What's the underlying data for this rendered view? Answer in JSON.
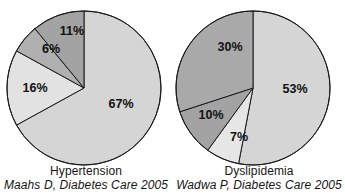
{
  "header": {
    "clipped_text_fragment": ""
  },
  "figure": {
    "background_color": "#ffffff",
    "outline_color": "#1a1a1a"
  },
  "panels": [
    {
      "id": "hypertension",
      "caption_title": "Hypertension",
      "caption_source": "Maahs D, Diabetes Care 2005"
    },
    {
      "id": "dyslipidemia",
      "caption_title": "Dyslipidemia",
      "caption_source": "Wadwa P, Diabetes Care 2005"
    }
  ],
  "chart_data": [
    {
      "type": "pie",
      "title": "Hypertension",
      "subtitle": "Maahs D, Diabetes Care 2005",
      "start_angle_deg": 0,
      "direction": "clockwise",
      "center": [
        84,
        88
      ],
      "radius": 77,
      "labels": [
        "67%",
        "16%",
        "6%",
        "11%"
      ],
      "values": [
        67,
        16,
        6,
        11
      ],
      "value_labels": [
        "67%",
        "16%",
        "6%",
        "11%"
      ],
      "colors": [
        "#d5d5d5",
        "#e2e2e2",
        "#b0b0b0",
        "#a3a3a3"
      ],
      "label_positions": [
        [
          121,
          105
        ],
        [
          35,
          89
        ],
        [
          51,
          50
        ],
        [
          72,
          32
        ]
      ],
      "legend": "none",
      "grid": false
    },
    {
      "type": "pie",
      "title": "Dyslipidemia",
      "subtitle": "Wadwa P, Diabetes Care 2005",
      "start_angle_deg": 0,
      "direction": "clockwise",
      "center": [
        80,
        88
      ],
      "radius": 77,
      "labels": [
        "53%",
        "7%",
        "10%",
        "30%"
      ],
      "values": [
        53,
        7,
        10,
        30
      ],
      "value_labels": [
        "53%",
        "7%",
        "10%",
        "30%"
      ],
      "colors": [
        "#d5d5d5",
        "#e6e6e6",
        "#a3a3a3",
        "#a9a9a9"
      ],
      "label_positions": [
        [
          122,
          90
        ],
        [
          66,
          138
        ],
        [
          38,
          116
        ],
        [
          57,
          48
        ]
      ],
      "legend": "none",
      "grid": false
    }
  ]
}
